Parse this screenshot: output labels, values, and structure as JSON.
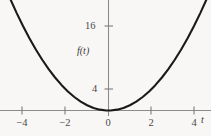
{
  "chart_data": {
    "type": "line",
    "title": "",
    "subtitle": "",
    "xlabel": "t",
    "ylabel": "f(t)",
    "function": "f(t) = t^2",
    "grid": false,
    "legend": false,
    "xlim": [
      -4.9,
      5.0
    ],
    "ylim": [
      -1.2,
      24.0
    ],
    "xticks": [
      -4,
      -2,
      0,
      2,
      4
    ],
    "xticklabels": [
      "−4",
      "−2",
      "0",
      "2",
      "4"
    ],
    "yticks": [
      4,
      16
    ],
    "yticklabels": [
      "4",
      "16"
    ],
    "series": [
      {
        "name": "f(t) = t^2",
        "color": "#1a1a1a",
        "x": [
          -4.9,
          -4.6,
          -4.3,
          -4.0,
          -3.7,
          -3.4,
          -3.1,
          -2.8,
          -2.5,
          -2.2,
          -1.9,
          -1.6,
          -1.3,
          -1.0,
          -0.7,
          -0.4,
          -0.1,
          0.0,
          0.1,
          0.4,
          0.7,
          1.0,
          1.3,
          1.6,
          1.9,
          2.2,
          2.5,
          2.8,
          3.1,
          3.4,
          3.7,
          4.0,
          4.3,
          4.6,
          4.9
        ],
        "y": [
          24.01,
          21.16,
          18.49,
          16.0,
          13.69,
          11.56,
          9.61,
          7.84,
          6.25,
          4.84,
          3.61,
          2.56,
          1.69,
          1.0,
          0.49,
          0.16,
          0.01,
          0.0,
          0.01,
          0.16,
          0.49,
          1.0,
          1.69,
          2.56,
          3.61,
          4.84,
          6.25,
          7.84,
          9.61,
          11.56,
          13.69,
          16.0,
          18.49,
          21.16,
          24.01
        ]
      }
    ],
    "colors": {
      "background": "#f8f7f5",
      "axis": "#8c8c8c",
      "curve": "#1a1a1a",
      "text": "#3f3f3f"
    }
  },
  "labels": {
    "y_axis": "f(t)",
    "x_axis": "t",
    "y_tick_16": "16",
    "y_tick_4": "4",
    "x_tick_neg4": "−4",
    "x_tick_neg2": "−2",
    "x_tick_zero": "0",
    "x_tick_2": "2",
    "x_tick_4": "4"
  }
}
